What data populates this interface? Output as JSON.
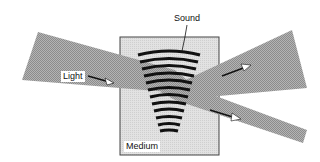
{
  "diagram": {
    "type": "acousto-optic interaction",
    "labels": {
      "sound": "Sound",
      "light": "Light",
      "medium": "Medium"
    },
    "colors": {
      "beam_fill": "#a8a8a8",
      "medium_fill": "#dcdcdc",
      "medium_border": "#444444",
      "sound_wave": "#111111",
      "arrow": "#111111",
      "background": "#ffffff"
    },
    "elements": [
      {
        "name": "incident-light-beam",
        "description": "Light beam entering medium from left"
      },
      {
        "name": "diffracted-beam-upper",
        "description": "Deflected light beam exiting upper right"
      },
      {
        "name": "transmitted-beam-lower",
        "description": "Undeflected light beam exiting lower right"
      },
      {
        "name": "medium-box",
        "description": "Rectangular medium"
      },
      {
        "name": "sound-wavefronts",
        "description": "Curved acoustic wavefronts in fan shape"
      }
    ],
    "sound_wavefront_count": 13
  }
}
